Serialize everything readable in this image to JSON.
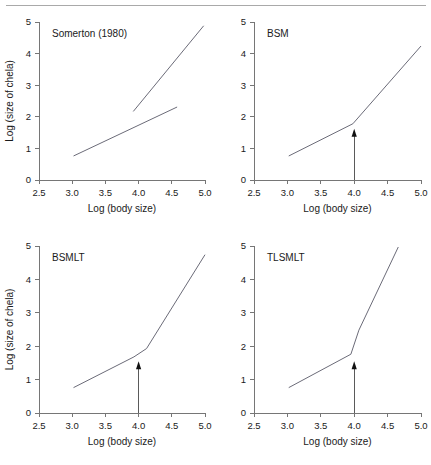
{
  "figure": {
    "top_rule": true,
    "panel_count": 4
  },
  "axes": {
    "xlabel": "Log (body size)",
    "ylabel": "Log (size of chela)",
    "xticks": [
      "2.5",
      "3.0",
      "3.5",
      "4.0",
      "4.5",
      "5.0"
    ],
    "yticks": [
      "0",
      "1",
      "2",
      "3",
      "4",
      "5"
    ],
    "xlim": [
      2.5,
      5.0
    ],
    "ylim": [
      0,
      5
    ]
  },
  "colors": {
    "line": "#6b6b78",
    "axis": "#767676",
    "arrow": "#111111",
    "background": "#ffffff",
    "rule": "#a9a9a9"
  },
  "chart_data": [
    {
      "type": "line",
      "title": "Somerton (1980)",
      "xlabel": "Log (body size)",
      "ylabel": "Log (size of chela)",
      "xlim": [
        2.5,
        5.0
      ],
      "ylim": [
        0,
        5
      ],
      "grid": false,
      "legend": "none",
      "has_arrow": false,
      "series": [
        {
          "name": "minor-chela-segment",
          "x": [
            3.02,
            4.58
          ],
          "y": [
            0.76,
            2.31
          ]
        },
        {
          "name": "major-chela-segment",
          "x": [
            3.92,
            4.98
          ],
          "y": [
            2.17,
            4.88
          ]
        }
      ]
    },
    {
      "type": "line",
      "title": "BSM",
      "xlabel": "Log (body size)",
      "ylabel": "Log (size of chela)",
      "xlim": [
        2.5,
        5.0
      ],
      "ylim": [
        0,
        5
      ],
      "grid": false,
      "legend": "none",
      "has_arrow": true,
      "arrow_x": 4.0,
      "arrow_y_top": 1.62,
      "series": [
        {
          "name": "fitted-breakpoint-line",
          "x": [
            3.02,
            3.98,
            5.0
          ],
          "y": [
            0.76,
            1.78,
            4.24
          ]
        }
      ]
    },
    {
      "type": "line",
      "title": "BSMLT",
      "xlabel": "Log (body size)",
      "ylabel": "Log (size of chela)",
      "xlim": [
        2.5,
        5.0
      ],
      "ylim": [
        0,
        5
      ],
      "grid": false,
      "legend": "none",
      "has_arrow": true,
      "arrow_x": 4.0,
      "arrow_y_top": 1.55,
      "series": [
        {
          "name": "fitted-breakpoint-line",
          "x": [
            3.02,
            3.93,
            4.12,
            5.0
          ],
          "y": [
            0.76,
            1.68,
            1.93,
            4.74
          ]
        }
      ]
    },
    {
      "type": "line",
      "title": "TLSMLT",
      "xlabel": "Log (body size)",
      "ylabel": "Log (size of chela)",
      "xlim": [
        2.5,
        5.0
      ],
      "ylim": [
        0,
        5
      ],
      "grid": false,
      "legend": "none",
      "has_arrow": true,
      "arrow_x": 4.0,
      "arrow_y_top": 1.55,
      "series": [
        {
          "name": "fitted-breakpoint-line",
          "x": [
            3.02,
            3.95,
            4.07,
            4.66
          ],
          "y": [
            0.76,
            1.76,
            2.48,
            4.97
          ]
        }
      ]
    }
  ],
  "panels": [
    {
      "id": "somerton",
      "title": "Somerton (1980)",
      "show_ylabel": true,
      "show_xlabel": true
    },
    {
      "id": "bsm",
      "title": "BSM",
      "show_ylabel": false,
      "show_xlabel": true
    },
    {
      "id": "bsmlt",
      "title": "BSMLT",
      "show_ylabel": true,
      "show_xlabel": true
    },
    {
      "id": "tlsmlt",
      "title": "TLSMLT",
      "show_ylabel": false,
      "show_xlabel": true
    }
  ]
}
